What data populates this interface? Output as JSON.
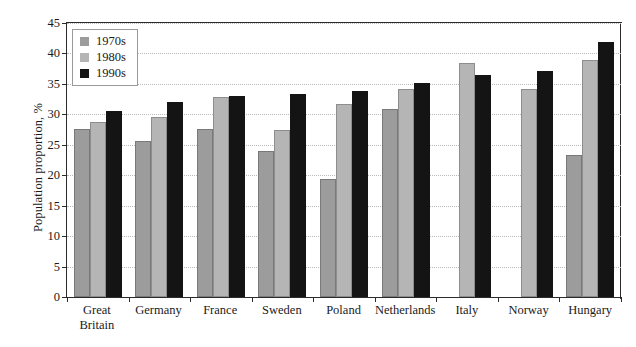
{
  "chart_data": {
    "type": "bar",
    "title": "",
    "xlabel": "",
    "ylabel": "Population proportion, %",
    "ylim": [
      0,
      45
    ],
    "ytick_step": 5,
    "yticks": [
      "45",
      "40",
      "35",
      "30",
      "25",
      "20",
      "15",
      "10",
      "5",
      "0"
    ],
    "grid": true,
    "legend_position": "top-left",
    "categories": [
      "Great Britain",
      "Germany",
      "France",
      "Sweden",
      "Poland",
      "Netherlands",
      "Italy",
      "Norway",
      "Hungary"
    ],
    "category_lines": [
      [
        "Great",
        "Britain"
      ],
      [
        "Germany"
      ],
      [
        "France"
      ],
      [
        "Sweden"
      ],
      [
        "Poland"
      ],
      [
        "Netherlands"
      ],
      [
        "Italy"
      ],
      [
        "Norway"
      ],
      [
        "Hungary"
      ]
    ],
    "series": [
      {
        "name": "1970s",
        "color": "#9c9c9c",
        "values": [
          27.6,
          25.6,
          27.6,
          23.9,
          19.4,
          30.8,
          null,
          null,
          23.3
        ]
      },
      {
        "name": "1980s",
        "color": "#b5b5b5",
        "values": [
          28.8,
          29.5,
          32.8,
          27.4,
          31.7,
          34.1,
          38.4,
          34.2,
          39.0
        ]
      },
      {
        "name": "1990s",
        "color": "#141414",
        "values": [
          30.6,
          32.0,
          33.0,
          33.4,
          33.8,
          35.2,
          36.4,
          37.2,
          41.9
        ]
      }
    ]
  },
  "legend": {
    "items": [
      {
        "label": "1970s",
        "color": "#9c9c9c"
      },
      {
        "label": "1980s",
        "color": "#b5b5b5"
      },
      {
        "label": "1990s",
        "color": "#141414"
      }
    ]
  },
  "axis": {
    "y_title": "Population proportion, %"
  }
}
